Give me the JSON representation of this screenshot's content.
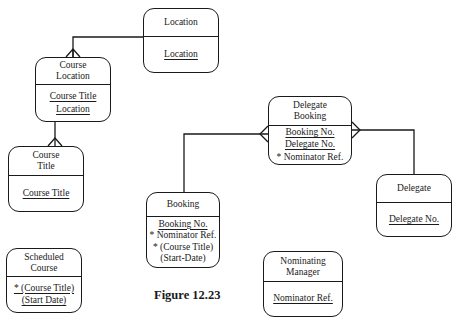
{
  "caption": "Figure 12.23",
  "entities": {
    "location": {
      "title": "Location",
      "attributes": [
        {
          "text": "Location",
          "key": true
        }
      ]
    },
    "course_location": {
      "title_line1": "Course",
      "title_line2": "Location",
      "attributes": [
        {
          "text": "Course Title",
          "key": true
        },
        {
          "text": "Location",
          "key": true
        }
      ]
    },
    "course_title": {
      "title_line1": "Course",
      "title_line2": "Title",
      "attributes": [
        {
          "text": "Course Title",
          "key": true
        }
      ]
    },
    "delegate_booking": {
      "title_line1": "Delegate",
      "title_line2": "Booking",
      "attributes": [
        {
          "text": "Booking No.",
          "key": true
        },
        {
          "text": "Delegate No.",
          "key": true
        },
        {
          "text": "* Nominator Ref.",
          "key": false
        }
      ]
    },
    "booking": {
      "title": "Booking",
      "attributes": [
        {
          "text": "Booking No.",
          "key": true
        },
        {
          "text": "* Nominator Ref.",
          "key": false
        },
        {
          "text": "* (Course Title)",
          "key": false
        },
        {
          "text": "(Start-Date)",
          "key": false
        }
      ]
    },
    "delegate": {
      "title": "Delegate",
      "attributes": [
        {
          "text": "Delegate No.",
          "key": true
        }
      ]
    },
    "scheduled_course": {
      "title_line1": "Scheduled",
      "title_line2": "Course",
      "attributes": [
        {
          "text": "* (Course Title)",
          "key": true
        },
        {
          "text": "(Start Date)",
          "key": true
        }
      ]
    },
    "nominating_manager": {
      "title_line1": "Nominating",
      "title_line2": "Manager",
      "attributes": [
        {
          "text": "Nominator Ref.",
          "key": true
        }
      ]
    }
  },
  "relationships": [
    {
      "from": "Location",
      "to": "Course Location",
      "type": "one-to-many"
    },
    {
      "from": "Course Location",
      "to": "Course Title",
      "type": "one-to-many"
    },
    {
      "from": "Booking",
      "to": "Delegate Booking",
      "type": "one-to-many"
    },
    {
      "from": "Delegate",
      "to": "Delegate Booking",
      "type": "one-to-many"
    }
  ]
}
